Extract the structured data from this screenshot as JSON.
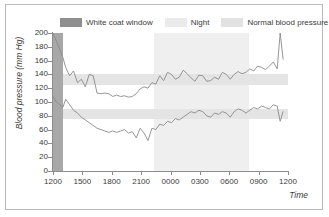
{
  "chart_data": {
    "type": "line",
    "title": "",
    "xlabel": "Time",
    "ylabel": "Blood pressure (mm Hg)",
    "ylim": [
      0,
      200
    ],
    "yticks": [
      0,
      20,
      40,
      60,
      80,
      100,
      120,
      140,
      160,
      180,
      200
    ],
    "xticks": [
      "1200",
      "1500",
      "1800",
      "2100",
      "0000",
      "0300",
      "0600",
      "0900",
      "1200"
    ],
    "xlim": [
      0,
      24
    ],
    "grid": false,
    "legend_position": "top",
    "legend": [
      {
        "label": "White coat window",
        "color": "#8f8f8f"
      },
      {
        "label": "Night",
        "color": "#ebebeb"
      },
      {
        "label": "Normal blood pressure",
        "color": "#e2e2e2"
      }
    ],
    "shaded_regions": [
      {
        "name": "white-coat-window",
        "type": "vertical",
        "x_start": 0.0,
        "x_end": 1.0,
        "color": "#a8a8a8"
      },
      {
        "name": "night",
        "type": "vertical",
        "x_start": 10.3,
        "x_end": 20.0,
        "color": "#efefef"
      },
      {
        "name": "normal-systolic-band",
        "type": "horizontal",
        "y_start": 125,
        "y_end": 140,
        "color": "#e4e4e4"
      },
      {
        "name": "normal-diastolic-band",
        "type": "horizontal",
        "y_start": 75,
        "y_end": 90,
        "color": "#e4e4e4"
      }
    ],
    "series": [
      {
        "name": "Systolic",
        "color": "#8a8a8a",
        "x": [
          0.0,
          0.35,
          0.7,
          1.0,
          1.3,
          1.7,
          2.1,
          2.5,
          2.9,
          3.3,
          3.7,
          4.1,
          4.5,
          4.9,
          5.3,
          5.7,
          6.1,
          6.5,
          6.9,
          7.3,
          7.7,
          8.1,
          8.5,
          8.9,
          9.3,
          9.7,
          10.1,
          10.5,
          10.9,
          11.3,
          11.7,
          12.1,
          12.5,
          12.9,
          13.3,
          13.7,
          14.1,
          14.5,
          14.9,
          15.3,
          15.7,
          16.1,
          16.5,
          16.9,
          17.3,
          17.7,
          18.1,
          18.5,
          18.9,
          19.3,
          19.7,
          20.1,
          20.5,
          20.9,
          21.3,
          21.7,
          22.1,
          22.5,
          22.9,
          23.2,
          23.5
        ],
        "values": [
          200,
          188,
          176,
          165,
          150,
          138,
          145,
          128,
          133,
          122,
          140,
          138,
          113,
          112,
          113,
          112,
          108,
          110,
          108,
          109,
          107,
          108,
          112,
          119,
          122,
          120,
          128,
          126,
          138,
          131,
          143,
          140,
          133,
          136,
          146,
          141,
          135,
          130,
          139,
          138,
          130,
          131,
          136,
          133,
          143,
          140,
          133,
          140,
          144,
          141,
          143,
          148,
          145,
          152,
          150,
          147,
          152,
          158,
          148,
          200,
          162
        ]
      },
      {
        "name": "Diastolic",
        "color": "#8a8a8a",
        "x": [
          0.0,
          0.35,
          0.7,
          1.0,
          1.3,
          1.7,
          2.1,
          2.5,
          2.9,
          3.3,
          3.7,
          4.1,
          4.5,
          4.9,
          5.3,
          5.7,
          6.1,
          6.5,
          6.9,
          7.3,
          7.7,
          8.1,
          8.5,
          8.9,
          9.3,
          9.7,
          10.1,
          10.5,
          10.9,
          11.3,
          11.7,
          12.1,
          12.5,
          12.9,
          13.3,
          13.7,
          14.1,
          14.5,
          14.9,
          15.3,
          15.7,
          16.1,
          16.5,
          16.9,
          17.3,
          17.7,
          18.1,
          18.5,
          18.9,
          19.3,
          19.7,
          20.1,
          20.5,
          20.9,
          21.3,
          21.7,
          22.1,
          22.5,
          22.9,
          23.2,
          23.5
        ],
        "values": [
          108,
          100,
          96,
          92,
          104,
          96,
          88,
          84,
          78,
          74,
          70,
          66,
          62,
          60,
          58,
          56,
          58,
          56,
          58,
          60,
          55,
          57,
          48,
          62,
          55,
          44,
          62,
          60,
          68,
          66,
          72,
          70,
          76,
          74,
          78,
          82,
          86,
          84,
          88,
          86,
          80,
          78,
          84,
          82,
          86,
          84,
          78,
          86,
          90,
          88,
          84,
          88,
          92,
          90,
          94,
          92,
          90,
          96,
          94,
          72,
          86
        ]
      }
    ]
  },
  "axis": {
    "y_title": "Blood pressure (mm Hg)",
    "x_title": "Time"
  }
}
